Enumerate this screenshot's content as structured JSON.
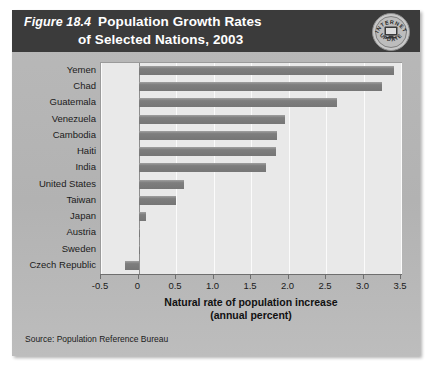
{
  "figure": {
    "number_label": "Figure 18.4",
    "title_line_1": "Population Growth Rates",
    "title_line_2": "of Selected Nations, 2003",
    "seal_top_text": "INTERNET",
    "seal_bottom_text": "UPDATE",
    "seal_icon": "computer-monitor-icon",
    "source": "Source:  Population Reference Bureau",
    "colors": {
      "header_bg": "#3b3b3b",
      "panel_bg": "#b3b3b3",
      "plot_bg": "#e9e9e9",
      "bar_fill": "#7e7e7e",
      "gridline": "#fbfbfb",
      "zero_line": "#8d8d8d",
      "text": "#1b1b1b"
    }
  },
  "chart_data": {
    "type": "bar",
    "orientation": "horizontal",
    "title": "Population Growth Rates of Selected Nations, 2003",
    "xlabel": "Natural rate of population increase (annual percent)",
    "xlabel_line_1": "Natural rate of population increase",
    "xlabel_line_2": "(annual percent)",
    "ylabel": "",
    "xlim": [
      -0.5,
      3.5
    ],
    "xticks": [
      -0.5,
      0,
      0.5,
      1.0,
      1.5,
      2.0,
      2.5,
      3.0,
      3.5
    ],
    "xtick_labels": [
      "-0.5",
      "0",
      "0.5",
      "1.0",
      "1.5",
      "2.0",
      "2.5",
      "3.0",
      "3.5"
    ],
    "grid": true,
    "legend": false,
    "categories": [
      "Yemen",
      "Chad",
      "Guatemala",
      "Venezuela",
      "Cambodia",
      "Haiti",
      "India",
      "United States",
      "Taiwan",
      "Japan",
      "Austria",
      "Sweden",
      "Czech Republic"
    ],
    "values": [
      3.4,
      3.25,
      2.65,
      1.95,
      1.85,
      1.83,
      1.7,
      0.6,
      0.5,
      0.1,
      0.02,
      0.02,
      -0.18
    ],
    "units": "percent per year",
    "source": "Population Reference Bureau"
  }
}
